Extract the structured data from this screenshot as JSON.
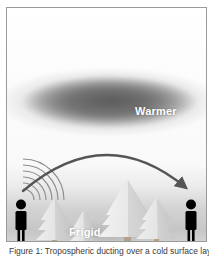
{
  "figure": {
    "caption": "Figure 1: Tropospheric ducting over a cold surface layer",
    "frame": {
      "border_color": "#9a9a9a",
      "background_color": "#fdfdfd"
    }
  },
  "labels": {
    "warm_layer": "Warmer",
    "cold_layer": "Frigid"
  },
  "colors": {
    "warm_band": "#6e6e6e",
    "cold_band": "#c4c4c4",
    "figure_silhouette": "#000000",
    "tree_fill": "#e3e3e3",
    "tree_shade": "#cfcfcf",
    "arrow": "#555555",
    "wave": "#8a8a8a",
    "label_text": "#ffffff"
  },
  "scene": {
    "transmitter": {
      "name": "person-left",
      "x": 20,
      "y": 202
    },
    "receiver": {
      "name": "person-right",
      "x": 190,
      "y": 202
    },
    "signal_arc": {
      "start_x": 22,
      "start_y": 185,
      "peak_x": 105,
      "peak_y": 141,
      "end_x": 186,
      "end_y": 189
    },
    "radio_waves": {
      "count": 6,
      "origin_x": 22,
      "origin_y": 198
    },
    "trees": [
      {
        "name": "tree-1",
        "x": 53,
        "base_y": 240,
        "height": 44,
        "width": 30
      },
      {
        "name": "tree-2",
        "x": 82,
        "base_y": 240,
        "height": 30,
        "width": 22
      },
      {
        "name": "tree-3",
        "x": 126,
        "base_y": 240,
        "height": 62,
        "width": 44
      },
      {
        "name": "tree-4",
        "x": 156,
        "base_y": 240,
        "height": 44,
        "width": 30
      }
    ]
  }
}
